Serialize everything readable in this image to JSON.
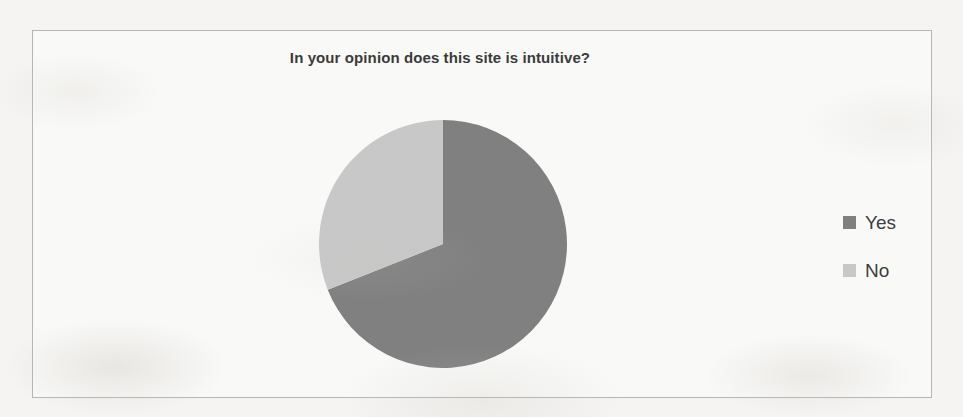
{
  "chart": {
    "title": "In your opinion does this site is intuitive?",
    "frame_border_color": "#b6b6b6",
    "background_color": "#f5f4f2"
  },
  "legend": {
    "position": "right",
    "entries": [
      {
        "label": "Yes",
        "color": "#808080",
        "swatch_name": "legend-swatch-yes"
      },
      {
        "label": "No",
        "color": "#c8c8c8",
        "swatch_name": "legend-swatch-no"
      }
    ]
  },
  "chart_data": {
    "type": "pie",
    "title": "In your opinion does this site is intuitive?",
    "xlabel": "",
    "ylabel": "",
    "categories": [
      "Yes",
      "No"
    ],
    "values": [
      69,
      31
    ],
    "value_unit": "percent",
    "colors": [
      "#808080",
      "#c8c8c8"
    ],
    "start_angle_deg": 0,
    "direction": "clockwise",
    "slices": [
      {
        "label": "Yes",
        "value": 69,
        "angle_deg": 248.4,
        "color": "#808080"
      },
      {
        "label": "No",
        "value": 31,
        "angle_deg": 111.6,
        "color": "#c8c8c8"
      }
    ],
    "legend_position": "right",
    "grid": false,
    "data_labels_shown": false
  }
}
